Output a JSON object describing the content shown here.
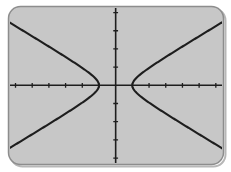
{
  "page": {
    "background": "#ffffff"
  },
  "screen": {
    "background": "#c7c7c7",
    "border_color": "#8d8d8d",
    "shadow_color": "#b7b7b7",
    "ink_color": "#1e1e1e"
  },
  "chart_data": {
    "type": "line",
    "title": "",
    "xlabel": "",
    "ylabel": "",
    "window": {
      "xmin": -6.3,
      "xmax": 6.4,
      "xscl": 1,
      "ymin": -4.3,
      "ymax": 4.25,
      "yscl": 1
    },
    "axes": {
      "x_ticks": [
        -6,
        -5,
        -4,
        -3,
        -2,
        -1,
        1,
        2,
        3,
        4,
        5,
        6
      ],
      "y_ticks": [
        -4,
        -3,
        -2,
        -1,
        1,
        2,
        3,
        4
      ],
      "grid": false,
      "tick_labels_shown": false,
      "legend": "none"
    },
    "model": {
      "form": "x^2/a^2 - y^2/b^2 = 1",
      "a": 1,
      "b": 0.55,
      "vertices": [
        [
          -1,
          0
        ],
        [
          1,
          0
        ]
      ],
      "asymptote_slopes": [
        0.55,
        -0.55
      ]
    },
    "series": [
      {
        "name": "left-branch",
        "points": [
          [
            -6.3,
            3.42
          ],
          [
            -6,
            3.25
          ],
          [
            -5.5,
            2.98
          ],
          [
            -5,
            2.69
          ],
          [
            -4.5,
            2.41
          ],
          [
            -4,
            2.13
          ],
          [
            -3.5,
            1.85
          ],
          [
            -3,
            1.56
          ],
          [
            -2.5,
            1.26
          ],
          [
            -2,
            0.95
          ],
          [
            -1.5,
            0.62
          ],
          [
            -1.2,
            0.36
          ],
          [
            -1,
            0
          ],
          [
            -1.2,
            -0.36
          ],
          [
            -1.5,
            -0.62
          ],
          [
            -2,
            -0.95
          ],
          [
            -2.5,
            -1.26
          ],
          [
            -3,
            -1.56
          ],
          [
            -3.5,
            -1.85
          ],
          [
            -4,
            -2.13
          ],
          [
            -4.5,
            -2.41
          ],
          [
            -5,
            -2.69
          ],
          [
            -5.5,
            -2.98
          ],
          [
            -6,
            -3.25
          ],
          [
            -6.3,
            -3.42
          ]
        ]
      },
      {
        "name": "right-branch",
        "points": [
          [
            6.4,
            3.48
          ],
          [
            6,
            3.25
          ],
          [
            5.5,
            2.98
          ],
          [
            5,
            2.69
          ],
          [
            4.5,
            2.41
          ],
          [
            4,
            2.13
          ],
          [
            3.5,
            1.85
          ],
          [
            3,
            1.56
          ],
          [
            2.5,
            1.26
          ],
          [
            2,
            0.95
          ],
          [
            1.5,
            0.62
          ],
          [
            1.2,
            0.36
          ],
          [
            1,
            0
          ],
          [
            1.2,
            -0.36
          ],
          [
            1.5,
            -0.62
          ],
          [
            2,
            -0.95
          ],
          [
            2.5,
            -1.26
          ],
          [
            3,
            -1.56
          ],
          [
            3.5,
            -1.85
          ],
          [
            4,
            -2.13
          ],
          [
            4.5,
            -2.41
          ],
          [
            5,
            -2.69
          ],
          [
            5.5,
            -2.98
          ],
          [
            6,
            -3.25
          ],
          [
            6.4,
            -3.48
          ]
        ]
      }
    ]
  }
}
